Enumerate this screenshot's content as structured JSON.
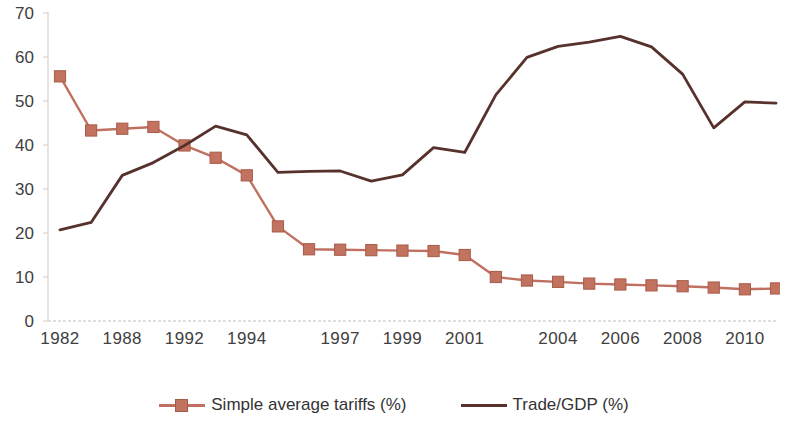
{
  "chart_data": {
    "type": "line",
    "title": "",
    "xlabel": "",
    "ylabel": "",
    "ylim": [
      0,
      70
    ],
    "y_ticks": [
      0,
      10,
      20,
      30,
      40,
      50,
      60,
      70
    ],
    "grid": false,
    "legend_position": "bottom",
    "x": [
      1982,
      1985,
      1988,
      1990,
      1992,
      1993,
      1994,
      1995,
      1996,
      1997,
      1998,
      1999,
      2000,
      2001,
      2002,
      2003,
      2004,
      2005,
      2006,
      2007,
      2008,
      2009,
      2010,
      2011
    ],
    "x_tick_labels": [
      "1982",
      "1988",
      "1992",
      "1994",
      "1997",
      "1999",
      "2001",
      "2004",
      "2006",
      "2008",
      "2010"
    ],
    "x_tick_values": [
      1982,
      1988,
      1992,
      1994,
      1997,
      1999,
      2001,
      2004,
      2006,
      2008,
      2010
    ],
    "series": [
      {
        "name": "Simple average tariffs (%)",
        "color": "#c07060",
        "marker": "square",
        "values": [
          55.6,
          43.3,
          43.7,
          44.1,
          39.9,
          37.1,
          33.1,
          21.5,
          16.3,
          16.2,
          16.1,
          16.0,
          15.9,
          15.0,
          10.0,
          9.2,
          8.9,
          8.5,
          8.3,
          8.1,
          7.9,
          7.6,
          7.2,
          7.4
        ]
      },
      {
        "name": "Trade/GDP (%)",
        "color": "#57322c",
        "marker": "none",
        "values": [
          20.7,
          22.4,
          33.1,
          36.0,
          39.9,
          44.3,
          42.3,
          33.8,
          34.0,
          34.1,
          31.8,
          33.2,
          39.4,
          38.3,
          51.4,
          59.9,
          62.4,
          63.4,
          64.7,
          62.3,
          56.1,
          43.9,
          49.8,
          49.5
        ]
      }
    ]
  },
  "legend": {
    "items": [
      {
        "label": "Simple average tariffs (%)",
        "color": "#c07060",
        "marker": "square"
      },
      {
        "label": "Trade/GDP (%)",
        "color": "#57322c",
        "marker": "none"
      }
    ]
  },
  "axis": {
    "y_labels": [
      "70",
      "60",
      "50",
      "40",
      "30",
      "20",
      "10",
      "0"
    ],
    "x_labels": [
      "1982",
      "1988",
      "1992",
      "1994",
      "1997",
      "1999",
      "2001",
      "2004",
      "2006",
      "2008",
      "2010"
    ]
  },
  "colors": {
    "tariff_line": "#c07060",
    "tariff_marker_fill": "#c2735f",
    "tariff_marker_stroke": "#a85a48",
    "trade_line": "#57322c",
    "axis_line": "#d9d4d2",
    "tick_text": "#404040",
    "legend_text": "#333333",
    "background": "#ffffff"
  }
}
